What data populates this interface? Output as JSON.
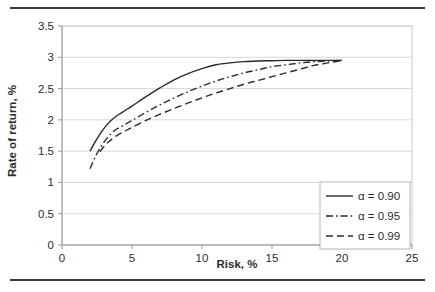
{
  "chart_data": {
    "type": "line",
    "title": "",
    "xlabel": "Risk, %",
    "ylabel": "Rate of return, %",
    "xlim": [
      0,
      25
    ],
    "ylim": [
      0,
      3.5
    ],
    "xticks": [
      "0",
      "5",
      "10",
      "15",
      "20",
      "25"
    ],
    "xtick_values": [
      0,
      5,
      10,
      15,
      20,
      25
    ],
    "yticks": [
      "0",
      "0.5",
      "1",
      "1.5",
      "2",
      "2.5",
      "3",
      "3.5"
    ],
    "ytick_values": [
      0,
      0.5,
      1,
      1.5,
      2,
      2.5,
      3,
      3.5
    ],
    "grid": "horizontal",
    "legend_position": "lower-right",
    "series": [
      {
        "name": "α = 0.90",
        "dash": "solid",
        "x": [
          2.0,
          2.4,
          2.8,
          3.2,
          3.7,
          4.3,
          5.0,
          6.0,
          7.0,
          8.0,
          9.0,
          10.0,
          11.0,
          12.0,
          13.0,
          14.0,
          15.0,
          16.0,
          17.0,
          18.0,
          19.0,
          20.0
        ],
        "y": [
          1.5,
          1.66,
          1.8,
          1.92,
          2.03,
          2.12,
          2.22,
          2.37,
          2.51,
          2.64,
          2.74,
          2.82,
          2.88,
          2.91,
          2.93,
          2.94,
          2.945,
          2.95,
          2.95,
          2.95,
          2.95,
          2.95
        ]
      },
      {
        "name": "α = 0.95",
        "dash": "dashdot",
        "x": [
          2.0,
          2.4,
          2.8,
          3.2,
          3.7,
          4.3,
          5.0,
          6.0,
          7.0,
          8.0,
          9.0,
          10.0,
          11.0,
          12.0,
          13.0,
          14.0,
          15.0,
          16.0,
          17.0,
          18.0,
          19.0,
          20.0
        ],
        "y": [
          1.22,
          1.42,
          1.58,
          1.7,
          1.82,
          1.9,
          1.99,
          2.12,
          2.24,
          2.35,
          2.45,
          2.54,
          2.62,
          2.69,
          2.75,
          2.8,
          2.85,
          2.88,
          2.91,
          2.93,
          2.94,
          2.95
        ]
      },
      {
        "name": "α = 0.99",
        "dash": "dashed",
        "x": [
          2.7,
          3.1,
          3.5,
          4.0,
          4.5,
          5.0,
          6.0,
          7.0,
          8.0,
          9.0,
          10.0,
          11.0,
          12.0,
          13.0,
          14.0,
          15.0,
          16.0,
          17.0,
          18.0,
          19.0,
          20.0
        ],
        "y": [
          1.49,
          1.6,
          1.68,
          1.76,
          1.82,
          1.88,
          1.99,
          2.09,
          2.18,
          2.27,
          2.35,
          2.43,
          2.5,
          2.57,
          2.63,
          2.69,
          2.75,
          2.81,
          2.87,
          2.91,
          2.95
        ]
      }
    ]
  },
  "legend": {
    "entries": [
      {
        "label": "α = 0.90"
      },
      {
        "label": "α = 0.95"
      },
      {
        "label": "α = 0.99"
      }
    ]
  },
  "colors": {
    "line": "#2a2a2a",
    "grid": "#d9d9d9",
    "axis": "#9a9a9a",
    "rule": "#3a3a3a"
  }
}
